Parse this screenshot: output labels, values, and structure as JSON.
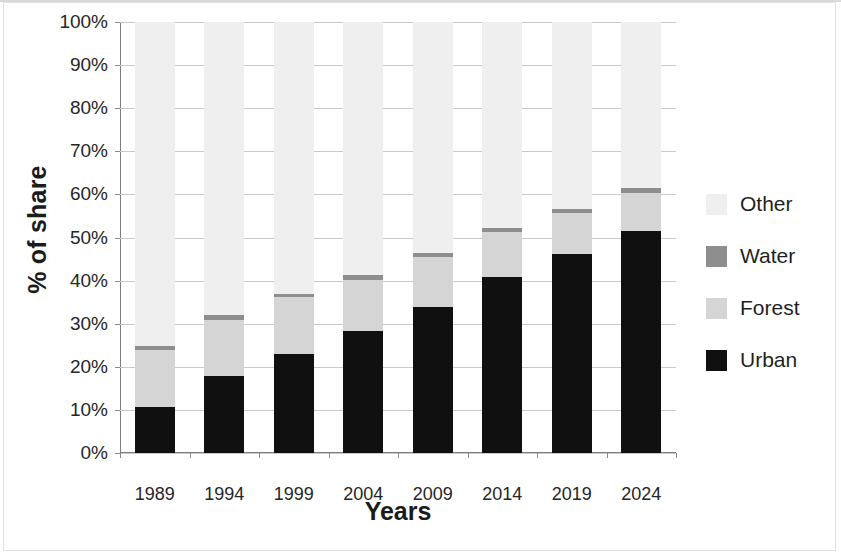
{
  "chart_data": {
    "type": "bar",
    "subtype": "stacked-bar-100-percent",
    "title": "",
    "xlabel": "Years",
    "ylabel": "% of share",
    "categories": [
      "1989",
      "1994",
      "1999",
      "2004",
      "2009",
      "2014",
      "2019",
      "2024"
    ],
    "ylim": [
      0,
      100
    ],
    "ytick_labels": [
      "0%",
      "10%",
      "20%",
      "30%",
      "40%",
      "50%",
      "60%",
      "70%",
      "80%",
      "90%",
      "100%"
    ],
    "ytick_values": [
      0,
      10,
      20,
      30,
      40,
      50,
      60,
      70,
      80,
      90,
      100
    ],
    "grid": true,
    "legend_position": "right",
    "series": [
      {
        "name": "Urban",
        "color": "#101010",
        "values": [
          10.7,
          17.8,
          22.9,
          28.3,
          33.9,
          40.9,
          46.2,
          51.6
        ]
      },
      {
        "name": "Forest",
        "color": "#d5d5d5",
        "values": [
          13.1,
          13.0,
          13.2,
          11.8,
          11.6,
          10.4,
          9.5,
          8.8
        ]
      },
      {
        "name": "Water",
        "color": "#8e8e8e",
        "values": [
          1.1,
          1.2,
          0.8,
          1.2,
          0.9,
          0.8,
          1.0,
          1.1
        ]
      },
      {
        "name": "Other",
        "color": "#efefef",
        "values": [
          75.1,
          68.0,
          63.1,
          58.7,
          53.6,
          47.9,
          43.3,
          38.5
        ]
      }
    ],
    "legend_entries": [
      "Other",
      "Water",
      "Forest",
      "Urban"
    ]
  }
}
